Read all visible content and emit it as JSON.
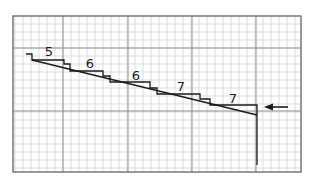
{
  "figure": {
    "colors": {
      "background": "#ffffff",
      "minor_grid": "#cfcfcf",
      "major_grid": "#8a8a8a",
      "border": "#6e6e6e",
      "ink": "#1a1a1a"
    },
    "grid": {
      "left": 13,
      "top": 16,
      "right": 301,
      "bottom": 172,
      "minor_step": 8,
      "major_x": [
        63,
        128,
        192,
        256
      ],
      "major_y": [
        48,
        111
      ]
    },
    "labels": [
      {
        "text": "5",
        "x": 49,
        "y": 56
      },
      {
        "text": "6",
        "x": 90,
        "y": 68
      },
      {
        "text": "6",
        "x": 136,
        "y": 80
      },
      {
        "text": "7",
        "x": 181,
        "y": 91
      },
      {
        "text": "7",
        "x": 233,
        "y": 103
      }
    ],
    "arrow": {
      "x1": 288,
      "y1": 107,
      "x2": 265,
      "y2": 107,
      "direction": "left"
    }
  }
}
